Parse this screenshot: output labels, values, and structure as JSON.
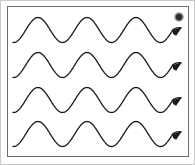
{
  "figure": {
    "width": 195,
    "height": 165,
    "background_color": "#ffffff",
    "outer_frame_color": "#c9c9c9",
    "inner_frame_color": "#6e6e6e",
    "stroke_color": "#1a1a1a",
    "stroke_width": 1.3
  },
  "inner_frame": {
    "x": 7,
    "y": 6,
    "width": 181,
    "height": 150
  },
  "corner_mark": {
    "name": "dot-glyph",
    "x": 174,
    "y": 12,
    "diameter": 10,
    "color": "#2b2b2b"
  },
  "chart_data": {
    "type": "line",
    "xlabel": "",
    "ylabel": "",
    "xlim": [
      13,
      183
    ],
    "ylim": [
      0,
      165
    ],
    "grid": false,
    "legend": "none",
    "wavelength": 49,
    "amplitude": 12.5,
    "phase_start_x": 13,
    "series": [
      {
        "name": "wave-1",
        "midline_y": 30,
        "start": [
          13,
          47
        ],
        "arrow_tip": [
          182,
          30
        ],
        "amplitude": 12.5,
        "wavelength": 49,
        "peaks_x": [
          38,
          87,
          136
        ],
        "troughs_x": [
          62,
          111,
          160
        ],
        "arrowhead": true
      },
      {
        "name": "wave-2",
        "midline_y": 65,
        "start": [
          13,
          82
        ],
        "arrow_tip": [
          182,
          65
        ],
        "amplitude": 12.5,
        "wavelength": 49,
        "peaks_x": [
          38,
          87,
          136
        ],
        "troughs_x": [
          62,
          111,
          160
        ],
        "arrowhead": true
      },
      {
        "name": "wave-3",
        "midline_y": 100,
        "start": [
          13,
          117
        ],
        "arrow_tip": [
          182,
          100
        ],
        "amplitude": 12.5,
        "wavelength": 49,
        "peaks_x": [
          38,
          87,
          136
        ],
        "troughs_x": [
          62,
          111,
          160
        ],
        "arrowhead": true
      },
      {
        "name": "wave-4",
        "midline_y": 134,
        "start": [
          13,
          151
        ],
        "arrow_tip": [
          182,
          134
        ],
        "amplitude": 12.5,
        "wavelength": 49,
        "peaks_x": [
          38,
          87,
          136
        ],
        "troughs_x": [
          62,
          111,
          160
        ],
        "arrowhead": true
      }
    ]
  }
}
